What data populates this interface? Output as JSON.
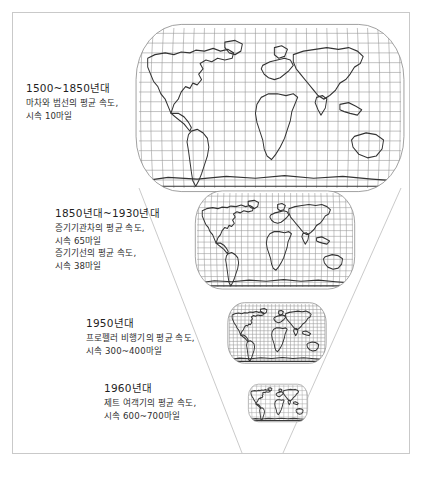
{
  "figure": {
    "title_visible": false,
    "background_color": "#ffffff",
    "frame_color": "#c9c9c9",
    "map_line_color": "#3a3a3a",
    "graticule_color": "#8f8f8f",
    "funnel_line_color": "#b5b5b5"
  },
  "captions": [
    {
      "year": "1500~1850년대",
      "lines": [
        "마차와 범선의 평균 속도,",
        "시속 10마일"
      ]
    },
    {
      "year": "1850년대~1930년대",
      "lines": [
        "증기기관차의 평균 속도,",
        "시속 65마일",
        "증기기선의 평균 속도,",
        "시속 38마일"
      ]
    },
    {
      "year": "1950년대",
      "lines": [
        "프로펠러 비행기의 평균 속도,",
        "시속 300~400마일"
      ]
    },
    {
      "year": "1960년대",
      "lines": [
        "제트 여객기의 평균 속도,",
        "시속 600~700마일"
      ]
    }
  ],
  "maps": [
    {
      "name": "world-map-largest",
      "cx": 270,
      "cy": 108,
      "rx": 131,
      "ry": 80
    },
    {
      "name": "world-map-large",
      "cx": 275,
      "cy": 240,
      "rx": 78,
      "ry": 47
    },
    {
      "name": "world-map-medium",
      "cx": 277,
      "cy": 333,
      "rx": 48,
      "ry": 29
    },
    {
      "name": "world-map-small",
      "cx": 278,
      "cy": 403,
      "rx": 29,
      "ry": 18
    }
  ],
  "funnel": {
    "left_top_x": 139,
    "left_bottom_x": 242,
    "right_top_x": 401,
    "right_bottom_x": 283,
    "top_y": 188,
    "bottom_y": 453
  }
}
